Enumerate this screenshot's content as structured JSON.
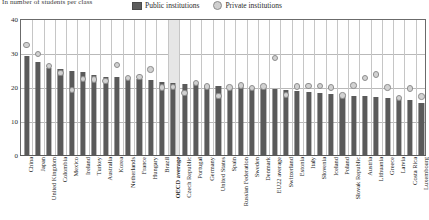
{
  "subtitle": "In number of students per class",
  "legend": {
    "position": "top-center",
    "items": [
      {
        "label": "Public institutions",
        "marker": "square-swatch",
        "color": "#5d5d5d"
      },
      {
        "label": "Private institutions",
        "marker": "circle-swatch",
        "color": "#cfcfcf"
      }
    ]
  },
  "colors": {
    "bar": "#5a5a5a",
    "marker_fill": "#d2d2d2",
    "marker_stroke": "#8d8d8d",
    "grid": "#b9b9b9",
    "axis": "#6b6b6b",
    "highlight_band": "#e6e6e6"
  },
  "highlight_category": "OECD average",
  "chart_data": {
    "type": "bar",
    "title": "",
    "subtitle": "In number of students per class",
    "xlabel": "",
    "ylabel": "",
    "ylim": [
      0,
      40
    ],
    "yticks": [
      0,
      10,
      20,
      30,
      40
    ],
    "grid": true,
    "legend_position": "top-center",
    "categories": [
      "China",
      "Japan",
      "United Kingdom",
      "Colombia",
      "Mexico",
      "Ireland",
      "Turkey",
      "Australia",
      "Korea",
      "Netherlands",
      "France",
      "Hungary",
      "Brazil",
      "OECD average",
      "Czech Republic",
      "Portugal",
      "Germany",
      "United States",
      "Spain",
      "Russian Federation",
      "Sweden",
      "Denmark",
      "EU22 average",
      "Switzerland",
      "Estonia",
      "Italy",
      "Slovenia",
      "Iceland",
      "Poland",
      "Slovak Republic",
      "Austria",
      "Lithuania",
      "Greece",
      "Latvia",
      "Costa Rica",
      "Luxembourg"
    ],
    "series": [
      {
        "name": "Public institutions",
        "values": [
          29.0,
          27.3,
          25.6,
          25.2,
          24.6,
          24.3,
          23.6,
          23.0,
          22.9,
          22.5,
          22.3,
          22.0,
          21.6,
          21.1,
          20.9,
          20.8,
          20.5,
          20.2,
          20.1,
          20.0,
          19.8,
          19.5,
          19.4,
          19.2,
          18.9,
          18.6,
          18.3,
          18.0,
          17.8,
          17.5,
          17.3,
          17.0,
          16.8,
          16.5,
          16.1,
          15.2
        ]
      },
      {
        "name": "Private institutions",
        "values": [
          32.6,
          30.0,
          26.5,
          24.5,
          19.5,
          22.6,
          22.5,
          22.1,
          26.8,
          23.0,
          23.3,
          25.5,
          20.1,
          20.3,
          18.6,
          21.5,
          20.4,
          17.6,
          20.2,
          20.7,
          20.0,
          20.5,
          28.8,
          18.0,
          20.4,
          20.6,
          20.6,
          20.2,
          17.8,
          20.7,
          22.9,
          24.0,
          20.2,
          17.0,
          19.8,
          17.5
        ]
      }
    ]
  }
}
